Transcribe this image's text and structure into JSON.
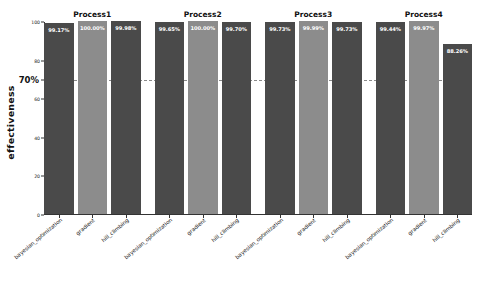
{
  "chart_data": {
    "type": "bar",
    "title": "",
    "xlabel": "",
    "ylabel": "effectiveness",
    "ylim": [
      0,
      100
    ],
    "yticks": [
      0,
      20,
      40,
      60,
      70,
      80,
      100
    ],
    "ytick_labels": [
      "0",
      "20",
      "40",
      "60",
      "70%",
      "80",
      "100"
    ],
    "grid": false,
    "legend": "none",
    "reference_line": {
      "value": 70,
      "label": "70%",
      "style": "dashed",
      "color": "#8a8a8a"
    },
    "categories": [
      "bayesian_optimization",
      "gradient",
      "hill_climbing"
    ],
    "groups": [
      {
        "name": "Process1",
        "bars": [
          {
            "category": "bayesian_optimization",
            "value": 99.17,
            "label": "99.17%",
            "color": "#4a4a4a"
          },
          {
            "category": "gradient",
            "value": 100.0,
            "label": "100.00%",
            "color": "#8c8c8c"
          },
          {
            "category": "hill_climbing",
            "value": 99.98,
            "label": "99.98%",
            "color": "#4a4a4a"
          }
        ]
      },
      {
        "name": "Process2",
        "bars": [
          {
            "category": "bayesian_optimization",
            "value": 99.65,
            "label": "99.65%",
            "color": "#4a4a4a"
          },
          {
            "category": "gradient",
            "value": 100.0,
            "label": "100.00%",
            "color": "#8c8c8c"
          },
          {
            "category": "hill_climbing",
            "value": 99.7,
            "label": "99.70%",
            "color": "#4a4a4a"
          }
        ]
      },
      {
        "name": "Process3",
        "bars": [
          {
            "category": "bayesian_optimization",
            "value": 99.73,
            "label": "99.73%",
            "color": "#4a4a4a"
          },
          {
            "category": "gradient",
            "value": 99.99,
            "label": "99.99%",
            "color": "#8c8c8c"
          },
          {
            "category": "hill_climbing",
            "value": 99.73,
            "label": "99.73%",
            "color": "#4a4a4a"
          }
        ]
      },
      {
        "name": "Process4",
        "bars": [
          {
            "category": "bayesian_optimization",
            "value": 99.44,
            "label": "99.44%",
            "color": "#4a4a4a"
          },
          {
            "category": "gradient",
            "value": 99.97,
            "label": "99.97%",
            "color": "#8c8c8c"
          },
          {
            "category": "hill_climbing",
            "value": 88.26,
            "label": "88.26%",
            "color": "#4a4a4a"
          }
        ]
      }
    ]
  }
}
